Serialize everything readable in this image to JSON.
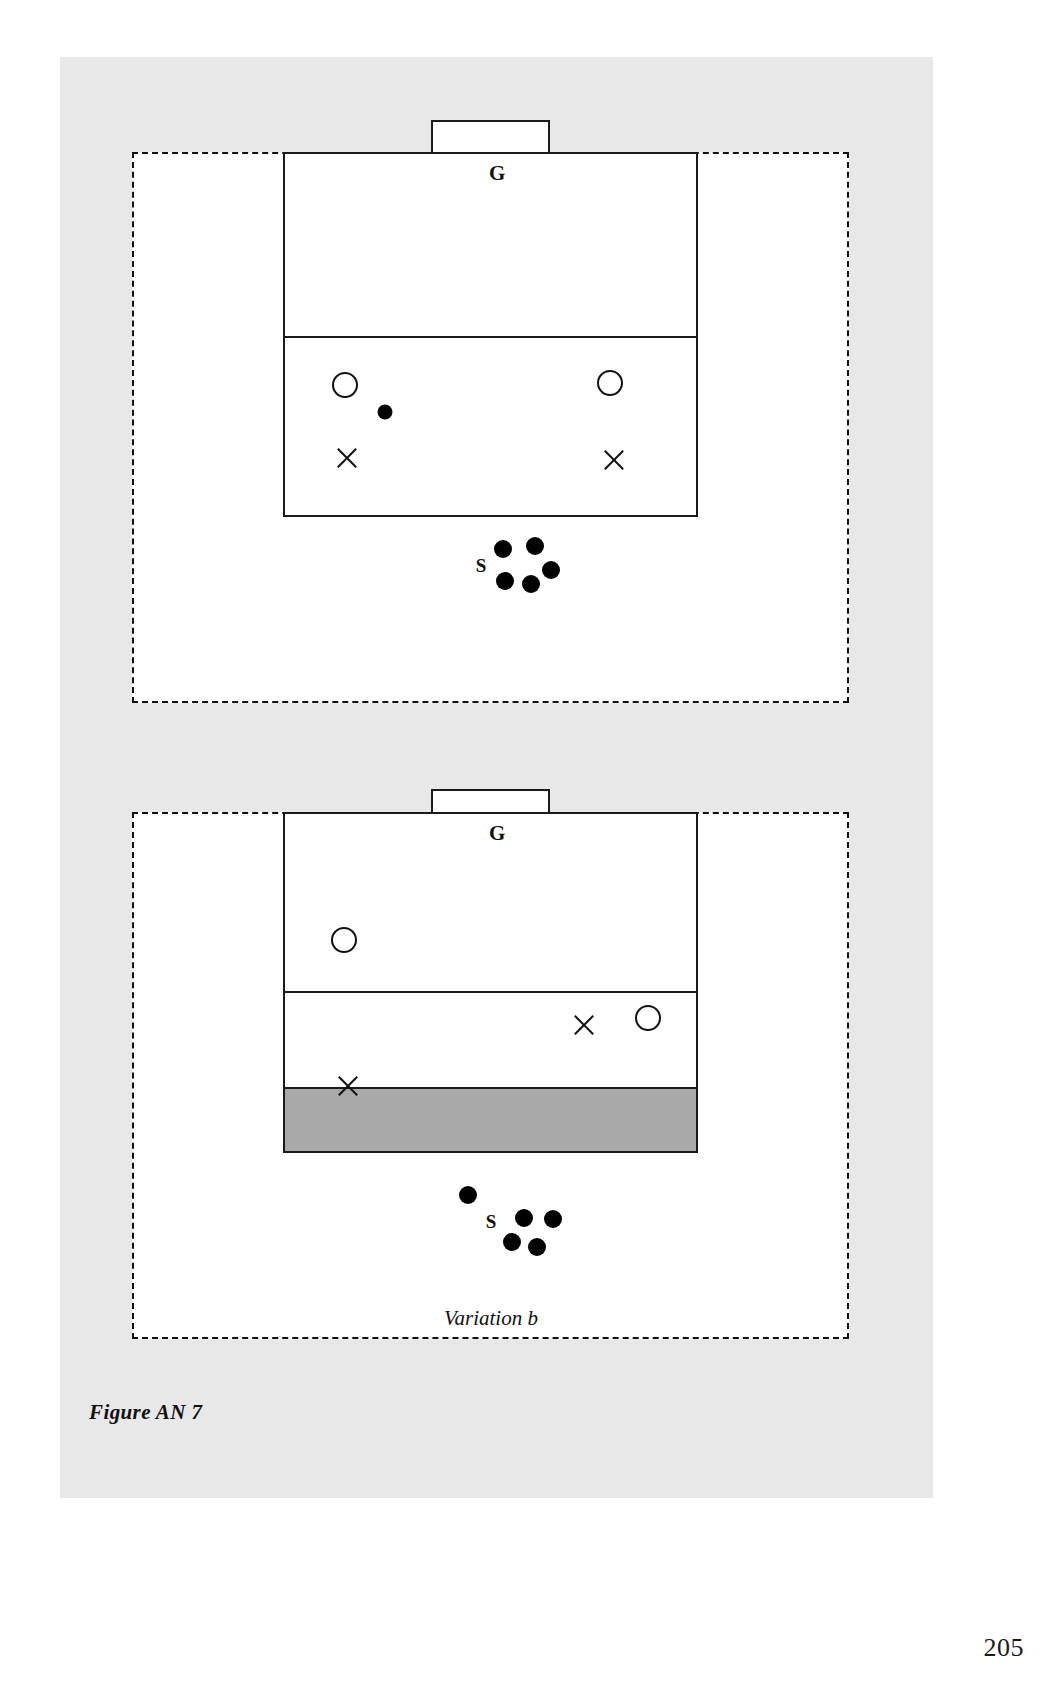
{
  "page": {
    "page_number": "205",
    "figure_caption": "Figure AN 7",
    "background_color": "#e8e8e8",
    "paper_color": "#ffffff",
    "ink_color": "#111111",
    "shade_color": "#a9a9a9"
  },
  "diagrams": [
    {
      "id": "diagram-a",
      "caption": "",
      "goal_label": "G",
      "server_label": "S",
      "zones": [
        {
          "name": "upper-zone",
          "shaded": false
        },
        {
          "name": "lower-zone",
          "shaded": false
        }
      ],
      "markers": [
        {
          "type": "circle",
          "name": "player-circle-left",
          "x": 345,
          "y": 385
        },
        {
          "type": "circle",
          "name": "player-circle-right",
          "x": 610,
          "y": 383
        },
        {
          "type": "dot",
          "name": "ball-in-play",
          "x": 385,
          "y": 412
        },
        {
          "type": "x",
          "name": "player-x-left",
          "x": 347,
          "y": 458
        },
        {
          "type": "x",
          "name": "player-x-right",
          "x": 614,
          "y": 460
        }
      ],
      "ball_pile": [
        {
          "x": 503,
          "y": 549
        },
        {
          "x": 535,
          "y": 546
        },
        {
          "x": 505,
          "y": 581
        },
        {
          "x": 531,
          "y": 584
        },
        {
          "x": 551,
          "y": 570
        }
      ]
    },
    {
      "id": "diagram-b",
      "caption": "Variation b",
      "goal_label": "G",
      "server_label": "S",
      "zones": [
        {
          "name": "upper-zone",
          "shaded": false
        },
        {
          "name": "middle-zone",
          "shaded": false
        },
        {
          "name": "lower-zone",
          "shaded": true
        }
      ],
      "markers": [
        {
          "type": "circle",
          "name": "player-circle-upper-left",
          "x": 344,
          "y": 940
        },
        {
          "type": "x",
          "name": "player-x-middle-right",
          "x": 584,
          "y": 1025
        },
        {
          "type": "circle",
          "name": "player-circle-middle-right",
          "x": 648,
          "y": 1018
        },
        {
          "type": "x",
          "name": "player-x-shaded-left",
          "x": 348,
          "y": 1086
        }
      ],
      "ball_pile": [
        {
          "x": 468,
          "y": 1195
        },
        {
          "x": 524,
          "y": 1218
        },
        {
          "x": 553,
          "y": 1219
        },
        {
          "x": 512,
          "y": 1242
        },
        {
          "x": 537,
          "y": 1247
        }
      ]
    }
  ]
}
